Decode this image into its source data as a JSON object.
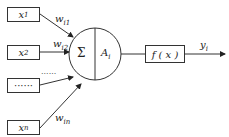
{
  "diagram": {
    "type": "artificial-neuron-model",
    "inputs": [
      {
        "label": "x",
        "sub": "1",
        "weight": "w",
        "weight_sub": "i1"
      },
      {
        "label": "x",
        "sub": "2",
        "weight": "w",
        "weight_sub": "i2"
      },
      {
        "label": "······",
        "sub": "",
        "weight": "······",
        "weight_sub": ""
      },
      {
        "label": "x",
        "sub": "n",
        "weight": "w",
        "weight_sub": "in"
      }
    ],
    "neuron": {
      "sum_symbol": "Σ",
      "activation": "A",
      "activation_sub": "i"
    },
    "transfer": {
      "label": "f ( x )"
    },
    "output": {
      "label": "y",
      "sub": "i"
    }
  }
}
